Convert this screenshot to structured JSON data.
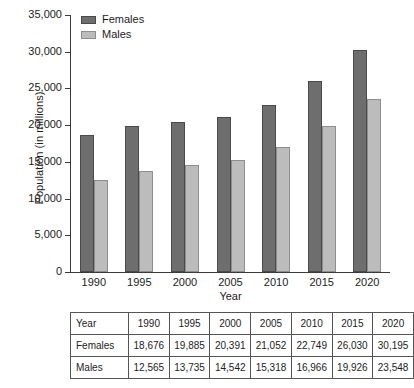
{
  "chart_data": {
    "type": "bar",
    "title": "",
    "xlabel": "Year",
    "ylabel": "Population (in millions)",
    "categories": [
      "1990",
      "1995",
      "2000",
      "2005",
      "2010",
      "2015",
      "2020"
    ],
    "series": [
      {
        "name": "Females",
        "color": "#6e6e6e",
        "values": [
          18676,
          19885,
          20391,
          21052,
          22749,
          26030,
          30195
        ]
      },
      {
        "name": "Males",
        "color": "#bcbcbc",
        "values": [
          12565,
          13735,
          14542,
          15318,
          16966,
          19926,
          23548
        ]
      }
    ],
    "ylim": [
      0,
      35000
    ],
    "ytick_step": 5000,
    "ytick_labels": [
      "0",
      "5,000",
      "10,000",
      "15,000",
      "20,000",
      "25,000",
      "30,000",
      "35,000"
    ],
    "grid": false,
    "legend_position": "top-left"
  },
  "table": {
    "rows": [
      [
        "Year",
        "1990",
        "1995",
        "2000",
        "2005",
        "2010",
        "2015",
        "2020"
      ],
      [
        "Females",
        "18,676",
        "19,885",
        "20,391",
        "21,052",
        "22,749",
        "26,030",
        "30,195"
      ],
      [
        "Males",
        "12,565",
        "13,735",
        "14,542",
        "15,318",
        "16,966",
        "19,926",
        "23,548"
      ]
    ]
  }
}
